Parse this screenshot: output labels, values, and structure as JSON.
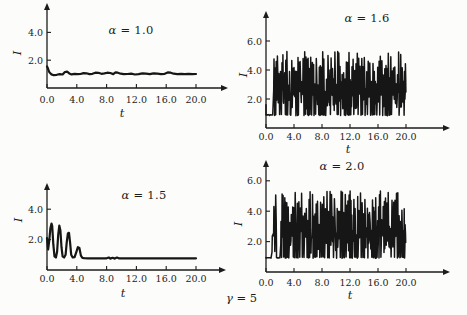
{
  "figure": {
    "background": "#fcfcfa",
    "ink": "#1c1c1c",
    "gamma_label": "γ = 5",
    "gamma_var": "γ",
    "gamma_rest": " = 5"
  },
  "chart_data": [
    {
      "id": "panel-top-left",
      "type": "line",
      "title": "α = 1.0",
      "title_var": "α",
      "title_rest": " = 1.0",
      "xlabel": "t",
      "ylabel": "I",
      "xlim": [
        0,
        20
      ],
      "ylim": [
        0,
        5.5
      ],
      "xticks": {
        "values": [
          0,
          4,
          8,
          12,
          16,
          20
        ],
        "labels": [
          "0.0",
          "4.0",
          "8.0",
          "12.0",
          "16.0",
          "20.0"
        ]
      },
      "yticks": {
        "values": [
          2,
          4
        ],
        "labels": [
          "2.0",
          "4.0"
        ]
      },
      "series": [
        {
          "name": "I(t)",
          "behavior": "starts near 1.5 and settles to a steady value ~1.0 with small fluctuations",
          "points": [
            [
              0,
              1.55
            ],
            [
              0.1,
              1.45
            ],
            [
              0.3,
              1.15
            ],
            [
              0.6,
              0.98
            ],
            [
              0.9,
              0.92
            ],
            [
              1.3,
              0.95
            ],
            [
              1.7,
              1.0
            ],
            [
              2.1,
              0.97
            ],
            [
              2.4,
              1.15
            ],
            [
              2.7,
              1.18
            ],
            [
              3.0,
              1.05
            ],
            [
              3.3,
              0.98
            ],
            [
              3.7,
              1.02
            ],
            [
              4.1,
              0.99
            ],
            [
              4.5,
              1.01
            ],
            [
              4.9,
              1.07
            ],
            [
              5.3,
              1.06
            ],
            [
              5.7,
              1.0
            ],
            [
              6.1,
              1.02
            ],
            [
              6.5,
              1.1
            ],
            [
              6.9,
              1.09
            ],
            [
              7.3,
              1.02
            ],
            [
              7.7,
              1.05
            ],
            [
              8.1,
              1.1
            ],
            [
              8.5,
              1.08
            ],
            [
              8.9,
              1.0
            ],
            [
              9.2,
              1.12
            ],
            [
              9.5,
              1.1
            ],
            [
              9.9,
              1.03
            ],
            [
              10.3,
              0.99
            ],
            [
              10.8,
              1.01
            ],
            [
              11.3,
              1.03
            ],
            [
              11.8,
              0.97
            ],
            [
              12.3,
              1.0
            ],
            [
              12.8,
              1.05
            ],
            [
              13.3,
              1.03
            ],
            [
              13.8,
              1.0
            ],
            [
              14.3,
              1.06
            ],
            [
              14.8,
              1.03
            ],
            [
              15.3,
              1.0
            ],
            [
              15.8,
              1.02
            ],
            [
              16.2,
              1.12
            ],
            [
              16.6,
              1.1
            ],
            [
              17.0,
              1.03
            ],
            [
              17.5,
              1.0
            ],
            [
              18.0,
              1.02
            ],
            [
              18.5,
              1.0
            ],
            [
              19.0,
              1.02
            ],
            [
              19.5,
              1.0
            ],
            [
              20,
              1.01
            ]
          ]
        }
      ]
    },
    {
      "id": "panel-top-right",
      "type": "line",
      "title": "α = 1.6",
      "title_var": "α",
      "title_rest": " = 1.6",
      "xlabel": "t",
      "ylabel": "I",
      "xlim": [
        0,
        20
      ],
      "ylim": [
        0,
        7.2
      ],
      "xticks": {
        "values": [
          0,
          4,
          8,
          12,
          16,
          20
        ],
        "labels": [
          "0.0",
          "4.0",
          "8.0",
          "12.0",
          "16.0",
          "20.0"
        ]
      },
      "yticks": {
        "values": [
          2,
          4,
          6
        ],
        "labels": [
          "2.0",
          "4.0",
          "6.0"
        ]
      },
      "series": [
        {
          "name": "I(t)",
          "behavior": "brief quiet start near 0.9 then sustained chaotic spiking between ~0.9 and ~5.3",
          "value_range": [
            0.9,
            5.3
          ],
          "generator": {
            "kind": "chaotic-spikes",
            "seed": 11,
            "start": 1.6,
            "low": 0.9,
            "peak_min": 2.4,
            "peak_max": 5.3,
            "cycle_min": 0.1,
            "cycle_max": 0.26,
            "quiet": [
              [
                0,
                1.0
              ],
              [
                3.3,
                3.6
              ]
            ],
            "tmax": 19.9
          }
        }
      ]
    },
    {
      "id": "panel-bottom-left",
      "type": "line",
      "title": "α = 1.5",
      "title_var": "α",
      "title_rest": " = 1.5",
      "xlabel": "t",
      "ylabel": "I",
      "xlim": [
        0,
        20
      ],
      "ylim": [
        0,
        5.5
      ],
      "xticks": {
        "values": [
          0,
          4,
          8,
          12,
          16,
          20
        ],
        "labels": [
          "0.0",
          "4.0",
          "8.0",
          "12.0",
          "16.0",
          "20.0"
        ]
      },
      "yticks": {
        "values": [
          2,
          4
        ],
        "labels": [
          "2.0",
          "4.0"
        ]
      },
      "series": [
        {
          "name": "I(t)",
          "behavior": "damped spiking: peaks ~3.0, 2.9, 2.4, 1.5 before t=5, then flat near 0.8",
          "points": [
            [
              0,
              2.1
            ],
            [
              0.15,
              1.35
            ],
            [
              0.3,
              1.9
            ],
            [
              0.45,
              2.75
            ],
            [
              0.6,
              3.05
            ],
            [
              0.7,
              2.9
            ],
            [
              0.85,
              1.7
            ],
            [
              1.0,
              0.9
            ],
            [
              1.2,
              0.82
            ],
            [
              1.35,
              1.2
            ],
            [
              1.5,
              2.3
            ],
            [
              1.65,
              2.92
            ],
            [
              1.8,
              2.6
            ],
            [
              1.95,
              1.5
            ],
            [
              2.1,
              0.9
            ],
            [
              2.3,
              0.82
            ],
            [
              2.5,
              1.0
            ],
            [
              2.65,
              1.8
            ],
            [
              2.8,
              2.4
            ],
            [
              2.95,
              2.45
            ],
            [
              3.1,
              1.8
            ],
            [
              3.25,
              1.0
            ],
            [
              3.45,
              0.82
            ],
            [
              3.7,
              0.85
            ],
            [
              3.95,
              1.2
            ],
            [
              4.15,
              1.5
            ],
            [
              4.35,
              1.45
            ],
            [
              4.55,
              0.95
            ],
            [
              4.75,
              0.8
            ],
            [
              5.0,
              0.78
            ],
            [
              5.5,
              0.77
            ],
            [
              6.0,
              0.76
            ],
            [
              7.0,
              0.76
            ],
            [
              8.0,
              0.77
            ],
            [
              8.3,
              0.82
            ],
            [
              8.5,
              0.75
            ],
            [
              8.8,
              0.8
            ],
            [
              9.1,
              0.75
            ],
            [
              9.4,
              0.82
            ],
            [
              9.7,
              0.76
            ],
            [
              10.0,
              0.77
            ],
            [
              11.0,
              0.76
            ],
            [
              12.0,
              0.77
            ],
            [
              13.0,
              0.76
            ],
            [
              14.0,
              0.77
            ],
            [
              15.0,
              0.76
            ],
            [
              16.0,
              0.77
            ],
            [
              17.0,
              0.76
            ],
            [
              18.0,
              0.77
            ],
            [
              19.0,
              0.76
            ],
            [
              20.0,
              0.77
            ]
          ]
        }
      ]
    },
    {
      "id": "panel-bottom-right",
      "type": "line",
      "title": "α = 2.0",
      "title_var": "α",
      "title_rest": " = 2.0",
      "xlabel": "t",
      "ylabel": "I",
      "xlim": [
        0,
        20
      ],
      "ylim": [
        0,
        6.9
      ],
      "xticks": {
        "values": [
          0,
          4,
          8,
          12,
          16,
          20
        ],
        "labels": [
          "0.0",
          "4.0",
          "8.0",
          "12.0",
          "16.0",
          "20.0"
        ]
      },
      "yticks": {
        "values": [
          2,
          4,
          6
        ],
        "labels": [
          "2.0",
          "4.0",
          "6.0"
        ]
      },
      "series": [
        {
          "name": "I(t)",
          "behavior": "flat near 0.95 until ~0.8, early spike burst, short lull, then dense chaotic spiking between ~0.95 and ~5.4",
          "value_range": [
            0.95,
            5.4
          ],
          "generator": {
            "kind": "chaotic-spikes",
            "seed": 29,
            "start": 0.95,
            "low": 0.95,
            "peak_min": 2.2,
            "peak_max": 5.35,
            "cycle_min": 0.1,
            "cycle_max": 0.26,
            "quiet": [
              [
                0,
                0.75
              ],
              [
                1.5,
                2.05
              ]
            ],
            "tmax": 19.9
          }
        }
      ]
    }
  ]
}
